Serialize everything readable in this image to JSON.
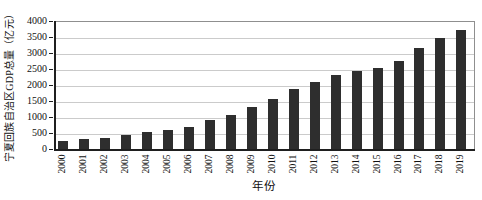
{
  "figure": {
    "background": "#ffffff"
  },
  "colors": {
    "bar": "#2e2e2e",
    "grid": "#cbcbcb",
    "axis": "#1f1f1f",
    "frame": "#8f8f8f",
    "text": "#111111"
  },
  "chart_data": {
    "type": "bar",
    "title": "",
    "xlabel": "年份",
    "ylabel": "宁夏回族自治区GDP总量（亿元）",
    "categories": [
      "2000",
      "2001",
      "2002",
      "2003",
      "2004",
      "2005",
      "2006",
      "2007",
      "2008",
      "2009",
      "2010",
      "2011",
      "2012",
      "2013",
      "2014",
      "2015",
      "2016",
      "2017",
      "2018",
      "2019"
    ],
    "values": [
      290,
      335,
      375,
      455,
      550,
      620,
      725,
      925,
      1100,
      1355,
      1580,
      1915,
      2140,
      2340,
      2480,
      2575,
      2780,
      3200,
      3510,
      3745
    ],
    "ylim": [
      0,
      4000
    ],
    "ytick_step": 500,
    "yticks": [
      0,
      500,
      1000,
      1500,
      2000,
      2500,
      3000,
      3500,
      4000
    ],
    "grid": "horizontal",
    "legend": null
  }
}
